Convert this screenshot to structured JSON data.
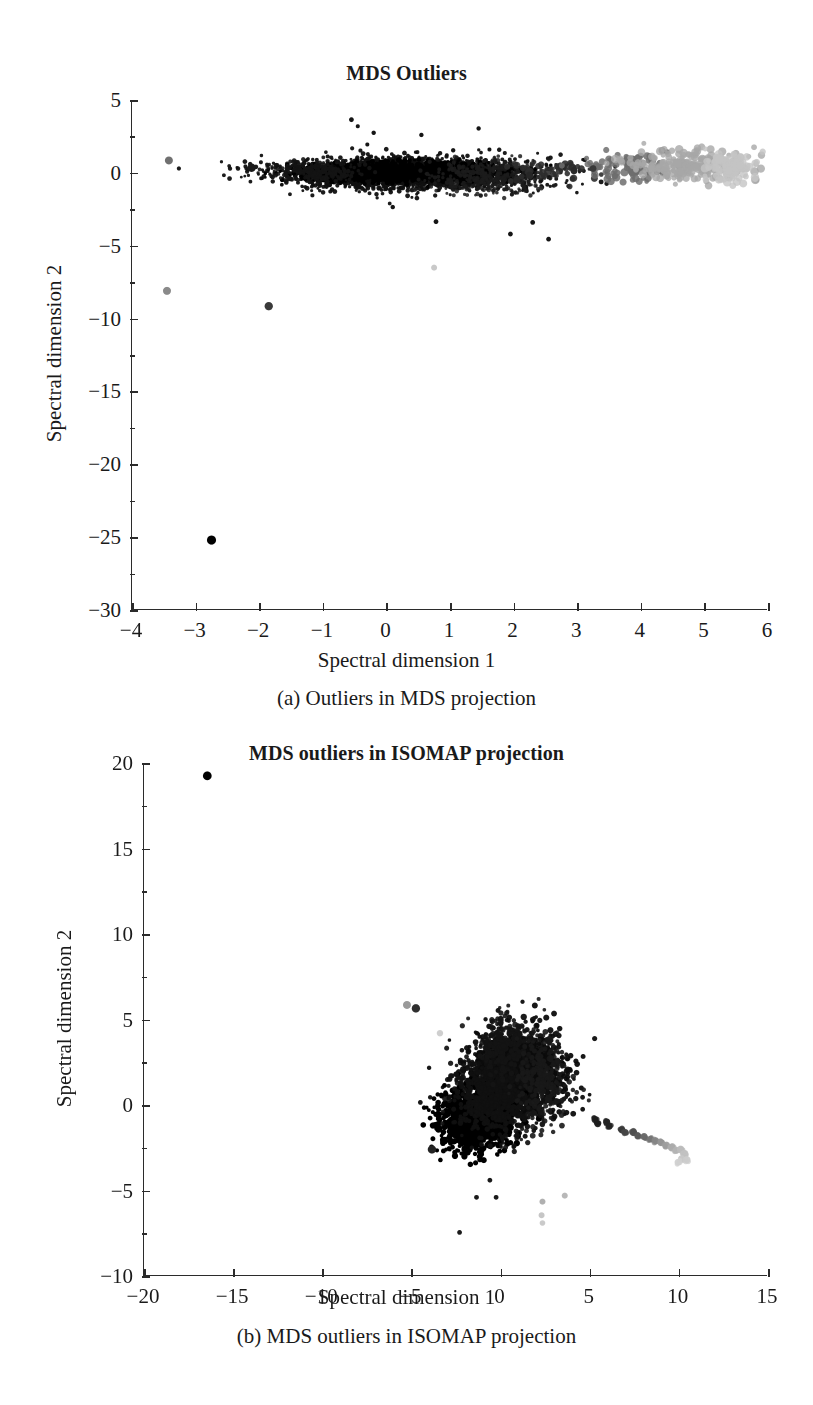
{
  "figure": {
    "background": "#ffffff",
    "ink_color": "#1a1a1a",
    "axis_color": "#2b2b2b"
  },
  "chart_data": [
    {
      "id": "panel-a",
      "type": "scatter",
      "title": "MDS Outliers",
      "caption": "(a) Outliers in MDS projection",
      "xlabel": "Spectral dimension 1",
      "ylabel": "Spectral dimension 2",
      "xlim": [
        -4,
        6
      ],
      "ylim": [
        -30,
        5
      ],
      "xticks": [
        -4,
        -3,
        -2,
        -1,
        0,
        1,
        2,
        3,
        4,
        5,
        6
      ],
      "xticklabels": [
        "−4",
        "−3",
        "−2",
        "−1",
        "0",
        "1",
        "2",
        "3",
        "4",
        "5",
        "6"
      ],
      "yticks": [
        5,
        0,
        -5,
        -10,
        -15,
        -20,
        -25,
        -30
      ],
      "yticklabels": [
        "5",
        "0",
        "−5",
        "−10",
        "−15",
        "−20",
        "−25",
        "−30"
      ],
      "grid": false,
      "legend": "none",
      "colormap": "grayscale-by-x",
      "clusters": [
        {
          "name": "dense-main-band",
          "n": 2600,
          "cx": 0.35,
          "cy": -0.05,
          "sx": 0.95,
          "sy": 0.52,
          "color": "#101010",
          "r": 1.9,
          "alpha": 0.95
        },
        {
          "name": "core-ridge",
          "n": 1500,
          "cx": 0.25,
          "cy": 0.05,
          "sx": 0.72,
          "sy": 0.3,
          "color": "#000000",
          "r": 2.2,
          "alpha": 1.0
        },
        {
          "name": "left-tail",
          "n": 260,
          "cx": -1.15,
          "cy": 0.05,
          "sx": 0.33,
          "sy": 0.32,
          "color": "#141414",
          "r": 1.8,
          "alpha": 0.9
        },
        {
          "name": "right-shoulder",
          "n": 340,
          "cx": 1.6,
          "cy": -0.25,
          "sx": 0.45,
          "sy": 0.55,
          "color": "#1c1c1c",
          "r": 1.8,
          "alpha": 0.85
        },
        {
          "name": "mid-dark-sparse",
          "n": 48,
          "cx": 2.75,
          "cy": 0.2,
          "sx": 0.45,
          "sy": 0.45,
          "color": "#2e2e2e",
          "r": 3.0,
          "alpha": 0.9
        },
        {
          "name": "gray-transition",
          "n": 95,
          "cx": 3.8,
          "cy": 0.35,
          "sx": 0.3,
          "sy": 0.5,
          "color": "#6f6f6f",
          "r": 3.2,
          "alpha": 0.85
        },
        {
          "name": "light-gray-cluster",
          "n": 230,
          "cx": 4.8,
          "cy": 0.5,
          "sx": 0.5,
          "sy": 0.55,
          "color": "#a8a8a8",
          "r": 3.4,
          "alpha": 0.8
        },
        {
          "name": "lightest-right-edge",
          "n": 110,
          "cx": 5.45,
          "cy": 0.35,
          "sx": 0.2,
          "sy": 0.5,
          "color": "#c4c4c4",
          "r": 3.4,
          "alpha": 0.8
        }
      ],
      "outliers": [
        {
          "x": -3.42,
          "y": 0.85,
          "color": "#707070",
          "r": 4.0
        },
        {
          "x": -2.12,
          "y": 0.35,
          "color": "#1a1a1a",
          "r": 4.2
        },
        {
          "x": -3.45,
          "y": -8.1,
          "color": "#8a8a8a",
          "r": 4.0
        },
        {
          "x": -1.85,
          "y": -9.15,
          "color": "#3a3a3a",
          "r": 4.2
        },
        {
          "x": -2.75,
          "y": -25.2,
          "color": "#000000",
          "r": 4.6
        },
        {
          "x": -0.55,
          "y": 3.65,
          "color": "#151515",
          "r": 2.4
        },
        {
          "x": -0.45,
          "y": 3.2,
          "color": "#151515",
          "r": 2.0
        },
        {
          "x": -0.2,
          "y": 2.75,
          "color": "#151515",
          "r": 2.2
        },
        {
          "x": 0.55,
          "y": 2.6,
          "color": "#151515",
          "r": 2.2
        },
        {
          "x": 1.45,
          "y": 3.05,
          "color": "#151515",
          "r": 2.2
        },
        {
          "x": -0.3,
          "y": 1.95,
          "color": "#151515",
          "r": 2.0
        },
        {
          "x": 1.05,
          "y": 1.55,
          "color": "#151515",
          "r": 2.2
        },
        {
          "x": 1.62,
          "y": 1.6,
          "color": "#151515",
          "r": 2.0
        },
        {
          "x": 0.1,
          "y": -2.35,
          "color": "#151515",
          "r": 2.2
        },
        {
          "x": 0.78,
          "y": -3.35,
          "color": "#151515",
          "r": 2.4
        },
        {
          "x": 2.3,
          "y": -3.4,
          "color": "#151515",
          "r": 2.4
        },
        {
          "x": 1.95,
          "y": -4.2,
          "color": "#151515",
          "r": 2.4
        },
        {
          "x": 2.55,
          "y": -4.55,
          "color": "#151515",
          "r": 2.4
        },
        {
          "x": 0.75,
          "y": -6.5,
          "color": "#c9c9c9",
          "r": 3.0
        },
        {
          "x": 2.05,
          "y": -0.5,
          "color": "#262626",
          "r": 3.6
        },
        {
          "x": 2.25,
          "y": -0.15,
          "color": "#262626",
          "r": 3.4
        },
        {
          "x": 2.95,
          "y": 0.15,
          "color": "#2a2a2a",
          "r": 3.6
        },
        {
          "x": 3.25,
          "y": 0.3,
          "color": "#3a3a3a",
          "r": 3.4
        }
      ]
    },
    {
      "id": "panel-b",
      "type": "scatter",
      "title": "MDS outliers in ISOMAP projection",
      "caption": "(b) MDS outliers in ISOMAP projection",
      "xlabel": "Spectral dimension 1",
      "ylabel": "Spectral dimension 2",
      "xlim": [
        -20,
        15
      ],
      "ylim": [
        -10,
        20
      ],
      "xticks": [
        -20,
        -15,
        -10,
        -5,
        0,
        5,
        10,
        15
      ],
      "xticklabels": [
        "−20",
        "−15",
        "−10",
        "−5",
        "0",
        "5",
        "10",
        "15"
      ],
      "yticks": [
        20,
        15,
        10,
        5,
        0,
        -5,
        -10
      ],
      "yticklabels": [
        "20",
        "15",
        "10",
        "5",
        "0",
        "−5",
        "−10"
      ],
      "grid": false,
      "legend": "none",
      "colormap": "grayscale-by-x",
      "clusters": [
        {
          "name": "main-blob-upper",
          "n": 1700,
          "cx": 0.9,
          "cy": 1.9,
          "sx": 1.25,
          "sy": 1.25,
          "color": "#0c0c0c",
          "r": 2.4,
          "alpha": 0.95
        },
        {
          "name": "main-blob-lower",
          "n": 1200,
          "cx": -1.5,
          "cy": -0.9,
          "sx": 0.95,
          "sy": 0.85,
          "color": "#000000",
          "r": 2.5,
          "alpha": 1.0
        },
        {
          "name": "blob-bridge",
          "n": 700,
          "cx": -0.3,
          "cy": 0.55,
          "sx": 1.1,
          "sy": 1.1,
          "color": "#101010",
          "r": 2.3,
          "alpha": 0.92
        },
        {
          "name": "blob-top-spur",
          "n": 230,
          "cx": 0.2,
          "cy": 3.5,
          "sx": 0.65,
          "sy": 0.8,
          "color": "#141414",
          "r": 2.3,
          "alpha": 0.9
        },
        {
          "name": "blob-right-edge",
          "n": 260,
          "cx": 2.4,
          "cy": 1.5,
          "sx": 0.7,
          "sy": 1.3,
          "color": "#181818",
          "r": 2.3,
          "alpha": 0.9
        }
      ],
      "tail": {
        "name": "gray-tail",
        "points": [
          {
            "x": 5.3,
            "y": -0.85,
            "color": "#1e1e1e",
            "r": 3.6
          },
          {
            "x": 5.45,
            "y": -1.1,
            "color": "#1e1e1e",
            "r": 3.4
          },
          {
            "x": 5.95,
            "y": -1.0,
            "color": "#242424",
            "r": 3.6
          },
          {
            "x": 6.1,
            "y": -1.25,
            "color": "#242424",
            "r": 3.4
          },
          {
            "x": 6.8,
            "y": -1.45,
            "color": "#3a3a3a",
            "r": 3.6
          },
          {
            "x": 7.0,
            "y": -1.6,
            "color": "#454545",
            "r": 3.4
          },
          {
            "x": 7.45,
            "y": -1.6,
            "color": "#4f4f4f",
            "r": 3.8
          },
          {
            "x": 7.7,
            "y": -1.8,
            "color": "#585858",
            "r": 3.4
          },
          {
            "x": 8.05,
            "y": -1.85,
            "color": "#6a6a6a",
            "r": 3.6
          },
          {
            "x": 8.4,
            "y": -2.0,
            "color": "#767676",
            "r": 3.4
          },
          {
            "x": 8.7,
            "y": -2.1,
            "color": "#868686",
            "r": 3.6
          },
          {
            "x": 9.0,
            "y": -2.2,
            "color": "#949494",
            "r": 3.6
          },
          {
            "x": 9.3,
            "y": -2.35,
            "color": "#9e9e9e",
            "r": 3.6
          },
          {
            "x": 9.6,
            "y": -2.5,
            "color": "#ababab",
            "r": 3.8
          },
          {
            "x": 9.85,
            "y": -2.65,
            "color": "#b4b4b4",
            "r": 3.6
          },
          {
            "x": 10.1,
            "y": -2.6,
            "color": "#bcbcbc",
            "r": 3.8
          },
          {
            "x": 10.3,
            "y": -2.85,
            "color": "#c2c2c2",
            "r": 3.8
          },
          {
            "x": 10.15,
            "y": -3.15,
            "color": "#c8c8c8",
            "r": 3.6
          },
          {
            "x": 10.45,
            "y": -3.2,
            "color": "#cccccc",
            "r": 3.6
          },
          {
            "x": 9.95,
            "y": -3.35,
            "color": "#d0d0d0",
            "r": 3.4
          }
        ]
      },
      "outliers": [
        {
          "x": -16.45,
          "y": 19.25,
          "color": "#000000",
          "r": 4.4
        },
        {
          "x": -5.25,
          "y": 5.85,
          "color": "#9a9a9a",
          "r": 4.0
        },
        {
          "x": -4.75,
          "y": 5.65,
          "color": "#2e2e2e",
          "r": 4.2
        },
        {
          "x": -3.4,
          "y": 4.2,
          "color": "#cfcfcf",
          "r": 3.2
        },
        {
          "x": -3.85,
          "y": -2.6,
          "color": "#242424",
          "r": 4.2
        },
        {
          "x": -4.5,
          "y": 0.15,
          "color": "#1a1a1a",
          "r": 2.4
        },
        {
          "x": -3.95,
          "y": 0.45,
          "color": "#1a1a1a",
          "r": 2.2
        },
        {
          "x": 1.3,
          "y": 5.15,
          "color": "#1a1a1a",
          "r": 3.2
        },
        {
          "x": 2.2,
          "y": 4.95,
          "color": "#1a1a1a",
          "r": 2.6
        },
        {
          "x": 3.55,
          "y": 0.35,
          "color": "#1a1a1a",
          "r": 2.4
        },
        {
          "x": 3.9,
          "y": 0.3,
          "color": "#1a1a1a",
          "r": 2.2
        },
        {
          "x": 4.6,
          "y": 0.45,
          "color": "#1a1a1a",
          "r": 2.4
        },
        {
          "x": -0.6,
          "y": -4.4,
          "color": "#1a1a1a",
          "r": 2.4
        },
        {
          "x": -1.35,
          "y": -5.4,
          "color": "#1a1a1a",
          "r": 2.4
        },
        {
          "x": -0.25,
          "y": -5.4,
          "color": "#1a1a1a",
          "r": 2.4
        },
        {
          "x": -2.3,
          "y": -7.45,
          "color": "#1a1a1a",
          "r": 2.4
        },
        {
          "x": 2.35,
          "y": -5.65,
          "color": "#b0b0b0",
          "r": 3.0
        },
        {
          "x": 3.6,
          "y": -5.3,
          "color": "#b8b8b8",
          "r": 3.0
        },
        {
          "x": 2.3,
          "y": -6.45,
          "color": "#c6c6c6",
          "r": 3.0
        },
        {
          "x": 2.35,
          "y": -6.9,
          "color": "#cacaca",
          "r": 2.8
        }
      ]
    }
  ]
}
